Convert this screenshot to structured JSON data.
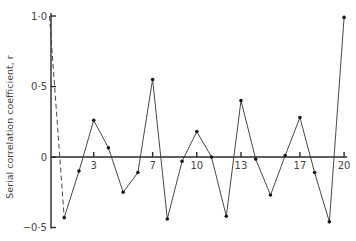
{
  "chart_data": {
    "type": "line",
    "title": "",
    "xlabel": "",
    "ylabel": "Serial correlation coefficient, r",
    "xlim": [
      0,
      20
    ],
    "ylim": [
      -0.5,
      1.0
    ],
    "grid": false,
    "legend": null,
    "x_tick_labels": [
      "3",
      "7",
      "10",
      "13",
      "17",
      "20"
    ],
    "x_ticks": [
      3,
      7,
      10,
      13,
      17,
      20
    ],
    "y_tick_labels": [
      "1·0",
      "0·5",
      "0",
      "−0·5"
    ],
    "y_ticks": [
      1.0,
      0.5,
      0,
      -0.5
    ],
    "series": [
      {
        "name": "serial correlation (lag 1–20)",
        "style": "solid",
        "markers": true,
        "x": [
          1,
          2,
          3,
          4,
          5,
          6,
          7,
          8,
          9,
          10,
          11,
          12,
          13,
          14,
          15,
          16,
          17,
          18,
          19,
          20
        ],
        "values": [
          -0.43,
          -0.1,
          0.26,
          0.065,
          -0.25,
          -0.11,
          0.55,
          -0.44,
          -0.03,
          0.18,
          0.0,
          -0.42,
          0.4,
          -0.015,
          -0.27,
          0.01,
          0.28,
          -0.11,
          -0.46,
          0.99
        ]
      },
      {
        "name": "lag 0 to lag 1 connector",
        "style": "dashed",
        "markers": false,
        "x": [
          0,
          1
        ],
        "values": [
          1.0,
          -0.43
        ]
      }
    ]
  },
  "axis": {
    "y_title": "Serial correlation coefficient, r"
  }
}
